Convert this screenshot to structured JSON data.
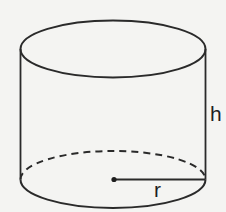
{
  "diagram": {
    "labels": {
      "height": "h",
      "radius": "r"
    },
    "colors": {
      "background": "#f4f4f2",
      "stroke": "#2a2a2a"
    },
    "geometry": {
      "top_ellipse": {
        "cx": 113,
        "cy": 49,
        "rx": 92.5,
        "ry": 28.5
      },
      "bottom_ellipse": {
        "cx": 113,
        "cy": 179.5,
        "rx": 92.5,
        "ry": 28.5
      },
      "center_point": {
        "x": 114,
        "y": 179.5
      },
      "radius_line": {
        "x1": 114,
        "y1": 179.5,
        "x2": 205.5,
        "y2": 179.5
      }
    }
  }
}
